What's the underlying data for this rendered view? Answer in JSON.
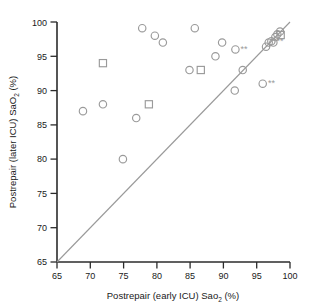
{
  "chart_data": {
    "type": "scatter",
    "title": "",
    "xlabel": "Postrepair (early ICU) Sao2 (%)",
    "xlabel_parts": {
      "pre": "Postrepair (early ICU) Sao",
      "sub": "2",
      "post": " (%)"
    },
    "ylabel": "Postrepair (later ICU) SaO2 (%)",
    "ylabel_parts": {
      "pre": "Postrepair (later ICU) SaO",
      "sub": "2",
      "post": " (%)"
    },
    "xlim": [
      65,
      100
    ],
    "ylim": [
      65,
      100
    ],
    "xticks": [
      65,
      70,
      75,
      80,
      85,
      90,
      95,
      100
    ],
    "yticks": [
      65,
      70,
      75,
      80,
      85,
      90,
      95,
      100
    ],
    "grid": false,
    "legend": "none",
    "reference_line": {
      "name": "identity-line",
      "from": [
        65,
        65
      ],
      "to": [
        100,
        100
      ],
      "color": "#9a9a9a"
    },
    "marker_color": "#9a9a9a",
    "annotation_symbol": "**",
    "series": [
      {
        "name": "circles",
        "marker": "circle",
        "points": [
          {
            "x": 68.9,
            "y": 87.0
          },
          {
            "x": 71.9,
            "y": 88.0
          },
          {
            "x": 74.9,
            "y": 80.0
          },
          {
            "x": 76.9,
            "y": 86.0
          },
          {
            "x": 77.8,
            "y": 99.1
          },
          {
            "x": 79.7,
            "y": 98.0
          },
          {
            "x": 80.9,
            "y": 97.0
          },
          {
            "x": 84.9,
            "y": 93.0
          },
          {
            "x": 85.7,
            "y": 99.1
          },
          {
            "x": 88.8,
            "y": 95.0
          },
          {
            "x": 89.8,
            "y": 97.0
          },
          {
            "x": 91.7,
            "y": 90.0
          },
          {
            "x": 91.8,
            "y": 96.0,
            "annotated": true
          },
          {
            "x": 92.9,
            "y": 93.0
          },
          {
            "x": 95.9,
            "y": 91.0,
            "annotated": true
          },
          {
            "x": 96.4,
            "y": 96.4
          },
          {
            "x": 96.8,
            "y": 97.0
          },
          {
            "x": 97.2,
            "y": 97.2,
            "annotated": true
          },
          {
            "x": 97.5,
            "y": 97.0
          },
          {
            "x": 97.8,
            "y": 97.8
          },
          {
            "x": 98.1,
            "y": 98.2
          },
          {
            "x": 98.5,
            "y": 98.6
          }
        ]
      },
      {
        "name": "squares",
        "marker": "square",
        "points": [
          {
            "x": 71.9,
            "y": 94.0
          },
          {
            "x": 78.8,
            "y": 88.0
          },
          {
            "x": 86.6,
            "y": 93.0
          },
          {
            "x": 98.6,
            "y": 98.1
          }
        ]
      }
    ]
  }
}
